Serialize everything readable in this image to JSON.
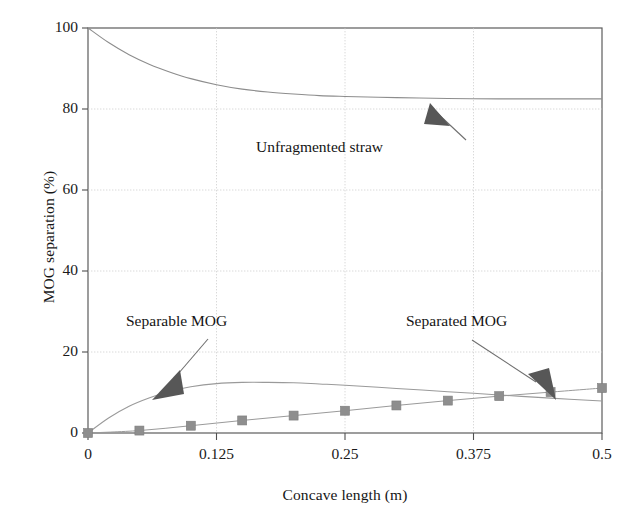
{
  "chart_data": {
    "type": "line",
    "title": "",
    "xlabel": "Concave length (m)",
    "ylabel": "MOG separation (%)",
    "xlim": [
      0,
      0.5
    ],
    "ylim": [
      0,
      100
    ],
    "xticks": [
      "0",
      "0.125",
      "0.25",
      "0.375",
      "0.5"
    ],
    "xtick_values": [
      0,
      0.125,
      0.25,
      0.375,
      0.5
    ],
    "yticks": [
      "0",
      "20",
      "40",
      "60",
      "80",
      "100"
    ],
    "ytick_values": [
      0,
      20,
      40,
      60,
      80,
      100
    ],
    "grid": true,
    "grid_style": "dotted-light",
    "legend": "none (inline arrow annotations)",
    "annotations": [
      {
        "text": "Unfragmented straw",
        "series": "Unfragmented straw",
        "arrow": "points up-right to curve at x=0.33, y=82.5"
      },
      {
        "text": "Separable MOG",
        "series": "Separable MOG",
        "arrow": "points down-left to curve at x=0.065, y=8"
      },
      {
        "text": "Separated MOG",
        "series": "Separated MOG",
        "arrow": "points down-right to marker at x=0.40, y=10"
      }
    ],
    "series": [
      {
        "name": "Unfragmented straw",
        "style": "thin solid line, no markers",
        "color": "#8d8d8d",
        "x": [
          0,
          0.02,
          0.04,
          0.06,
          0.08,
          0.1,
          0.125,
          0.15,
          0.175,
          0.2,
          0.225,
          0.25,
          0.3,
          0.35,
          0.4,
          0.45,
          0.5
        ],
        "values": [
          100,
          96.4,
          93.4,
          91.0,
          89.1,
          87.5,
          86.0,
          84.9,
          84.2,
          83.7,
          83.3,
          83.1,
          82.8,
          82.6,
          82.5,
          82.5,
          82.5
        ]
      },
      {
        "name": "Separable MOG",
        "style": "thin solid line, no markers",
        "color": "#9a9a9a",
        "x": [
          0,
          0.02,
          0.04,
          0.06,
          0.08,
          0.1,
          0.125,
          0.15,
          0.175,
          0.2,
          0.225,
          0.25,
          0.3,
          0.35,
          0.4,
          0.45,
          0.5
        ],
        "values": [
          0,
          3.7,
          6.6,
          8.7,
          10.3,
          11.4,
          12.2,
          12.5,
          12.5,
          12.4,
          12.1,
          11.8,
          11.0,
          10.2,
          9.4,
          8.6,
          7.9
        ]
      },
      {
        "name": "Separated MOG",
        "style": "thin solid line with filled square markers",
        "color": "#9a9a9a",
        "marker": "square",
        "marker_color": "#8e8e8e",
        "x": [
          0,
          0.05,
          0.1,
          0.15,
          0.2,
          0.25,
          0.3,
          0.35,
          0.4,
          0.45,
          0.5
        ],
        "values": [
          0,
          0.6,
          1.8,
          3.1,
          4.3,
          5.5,
          6.8,
          8.0,
          9.1,
          10.1,
          11.1
        ]
      }
    ]
  },
  "axes": {
    "y_title": "MOG separation (%)",
    "x_title": "Concave length (m)"
  }
}
